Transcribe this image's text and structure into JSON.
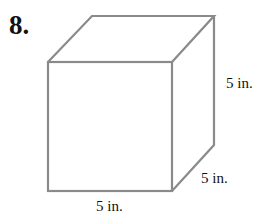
{
  "problem": {
    "number": "8.",
    "figure": "cube",
    "labels": {
      "height": "5 in.",
      "depth": "5 in.",
      "width": "5 in."
    },
    "colors": {
      "edge": "#8a8a8a",
      "text": "#111111"
    }
  }
}
